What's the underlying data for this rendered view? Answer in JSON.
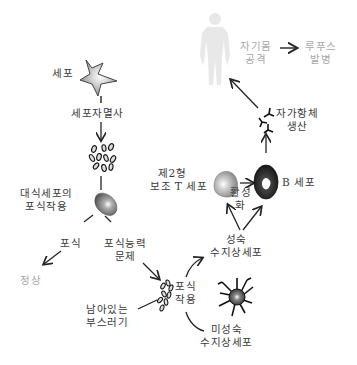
{
  "diagram": {
    "nodes": {
      "cell": {
        "label": "세포"
      },
      "apoptosis": {
        "label": "세포자멸사"
      },
      "macrophage": {
        "label_line1": "대식세포의",
        "label_line2": "포식작용"
      },
      "phagocytosis_ok": {
        "label": "포식"
      },
      "normal": {
        "label": "정상"
      },
      "phagocytosis_problem": {
        "label_line1": "포식능력",
        "label_line2": "문제"
      },
      "debris": {
        "label_line1": "남아있는",
        "label_line2": "부스러기"
      },
      "phagocytosis2": {
        "label_line1": "포식",
        "label_line2": "작용"
      },
      "immature_dc": {
        "label_line1": "미성숙",
        "label_line2": "수지상세포"
      },
      "mature_dc": {
        "label_line1": "성숙",
        "label_line2": "수지상세포"
      },
      "activation": {
        "label_line1": "활성",
        "label_line2": "화"
      },
      "th2": {
        "label_line1": "제2형",
        "label_line2": "보조 T 세포"
      },
      "bcell": {
        "label": "B 세포"
      },
      "autoantibody": {
        "label_line1": "자가항체",
        "label_line2": "생산"
      },
      "self_attack": {
        "label_line1": "자기몸",
        "label_line2": "공격"
      },
      "lupus": {
        "label_line1": "루푸스",
        "label_line2": "발병"
      }
    },
    "colors": {
      "text": "#3a3a3a",
      "faded_text": "#a8a8a8",
      "body_silhouette": "#e6e6e6",
      "arrow": "#222222"
    }
  }
}
